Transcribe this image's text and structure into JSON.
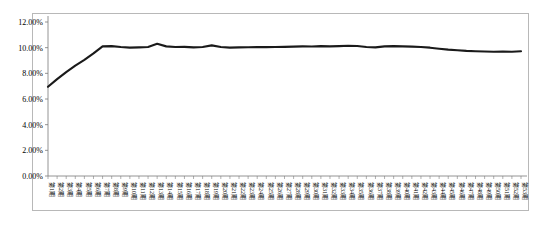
{
  "chart_data": {
    "type": "line",
    "title": "",
    "xlabel": "",
    "ylabel": "",
    "ylim": [
      0,
      12
    ],
    "ytick_labels": [
      "0.00%",
      "2.00%",
      "4.00%",
      "6.00%",
      "8.00%",
      "10.00%",
      "12.00%"
    ],
    "ytick_values": [
      0,
      2,
      4,
      6,
      8,
      10,
      12
    ],
    "grid": false,
    "legend": "none",
    "line_color": "#1a1a1a",
    "categories": [
      "第1期",
      "第2期",
      "第3期",
      "第4期",
      "第5期",
      "第6期",
      "第7期",
      "第8期",
      "第9期",
      "第10期",
      "第11期",
      "第12期",
      "第13期",
      "第14期",
      "第15期",
      "第16期",
      "第17期",
      "第18期",
      "第19期",
      "第20期",
      "第21期",
      "第22期",
      "第23期",
      "第24期",
      "第25期",
      "第26期",
      "第27期",
      "第28期",
      "第29期",
      "第30期",
      "第31期",
      "第32期",
      "第33期",
      "第34期",
      "第35期",
      "第36期",
      "第37期",
      "第38期",
      "第39期",
      "第40期",
      "第41期",
      "第42期",
      "第43期",
      "第44期",
      "第45期",
      "第46期",
      "第47期",
      "第48期",
      "第49期",
      "第50期",
      "第51期",
      "第52期",
      "第53期"
    ],
    "values": [
      6.95,
      7.55,
      8.1,
      8.6,
      9.05,
      9.55,
      10.1,
      10.12,
      10.05,
      10.0,
      10.02,
      10.05,
      10.3,
      10.1,
      10.05,
      10.06,
      10.02,
      10.05,
      10.18,
      10.05,
      10.0,
      10.02,
      10.03,
      10.05,
      10.04,
      10.05,
      10.06,
      10.08,
      10.1,
      10.09,
      10.12,
      10.1,
      10.12,
      10.15,
      10.13,
      10.05,
      10.02,
      10.1,
      10.12,
      10.1,
      10.08,
      10.05,
      10.0,
      9.92,
      9.85,
      9.8,
      9.75,
      9.72,
      9.7,
      9.68,
      9.7,
      9.68,
      9.72
    ]
  }
}
